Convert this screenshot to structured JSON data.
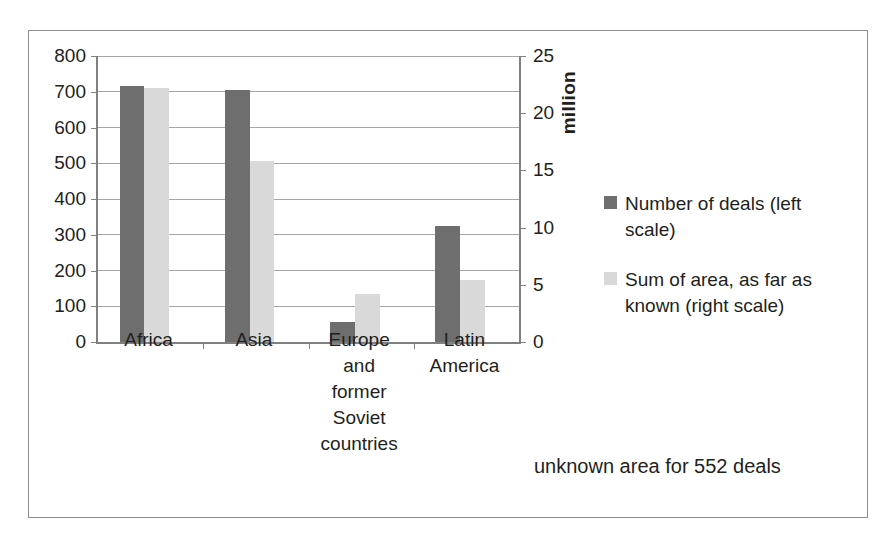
{
  "chart_data": {
    "type": "bar",
    "title": "",
    "subtitle": "",
    "xlabel": "",
    "ylabel": "",
    "grid": true,
    "legend_position": "right",
    "categories": [
      "Africa",
      "Asia",
      "Europe and former Soviet countries",
      "Latin America"
    ],
    "category_lines": [
      [
        "Africa"
      ],
      [
        "Asia"
      ],
      [
        "Europe",
        "and",
        "former",
        "Soviet",
        "countries"
      ],
      [
        "Latin",
        "America"
      ]
    ],
    "series": [
      {
        "name": "Number of deals (left scale)",
        "axis": "left",
        "color": "#6e6e6e",
        "values": [
          716,
          705,
          55,
          325
        ]
      },
      {
        "name": "Sum of area, as far as known (right scale)",
        "axis": "right",
        "color": "#d9d9d9",
        "values": [
          22.2,
          15.8,
          4.2,
          5.4
        ]
      }
    ],
    "left_axis": {
      "label": "",
      "min": 0,
      "max": 800,
      "step": 100,
      "ticks": [
        "0",
        "100",
        "200",
        "300",
        "400",
        "500",
        "600",
        "700",
        "800"
      ]
    },
    "right_axis": {
      "label": "million",
      "min": 0,
      "max": 25,
      "step": 5,
      "ticks": [
        "0",
        "5",
        "10",
        "15",
        "20",
        "25"
      ]
    },
    "annotations": [
      "unknown area for 552 deals"
    ]
  },
  "legend": {
    "items": [
      {
        "label": "Number of deals (left",
        "label2": "scale)",
        "color": "#6e6e6e"
      },
      {
        "label": "Sum of area, as far as",
        "label2": "known (right scale)",
        "color": "#d9d9d9"
      }
    ]
  },
  "annotation": {
    "text": "unknown area for 552 deals"
  },
  "axis_titles": {
    "right": "million"
  }
}
